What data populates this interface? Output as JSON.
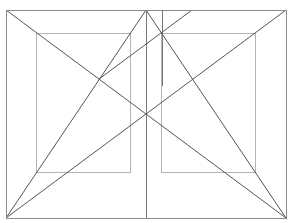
{
  "diagram": {
    "type": "geometric-composition-grid",
    "colors": {
      "background": "#ffffff",
      "outer_frame": "#8a8a8a",
      "inner_frames": "#b4b4b4",
      "diagonals": "#555555",
      "verticals": "#7a7a7a"
    },
    "outer_rect": {
      "x": 6,
      "y": 10,
      "w": 280,
      "h": 208
    },
    "inner_rects": [
      {
        "id": "left-inner",
        "x": 36,
        "y": 33,
        "w": 94,
        "h": 139
      },
      {
        "id": "right-inner",
        "x": 161,
        "y": 33,
        "w": 94,
        "h": 139
      }
    ],
    "vertical_lines": [
      {
        "id": "center-vertical",
        "x": 146,
        "y1": 10,
        "y2": 218
      },
      {
        "id": "short-vertical",
        "x": 162,
        "y1": 10,
        "y2": 86
      }
    ],
    "diagonal_lines": [
      {
        "id": "tl-to-br",
        "x1": 6,
        "y1": 10,
        "x2": 286,
        "y2": 218
      },
      {
        "id": "bl-to-tr",
        "x1": 6,
        "y1": 218,
        "x2": 286,
        "y2": 10
      },
      {
        "id": "bl-to-top-center",
        "x1": 6,
        "y1": 218,
        "x2": 146,
        "y2": 10
      },
      {
        "id": "top-center-to-br",
        "x1": 146,
        "y1": 10,
        "x2": 286,
        "y2": 218
      },
      {
        "id": "intersection-to-top",
        "x1": 99,
        "y1": 79,
        "x2": 192,
        "y2": 10
      }
    ]
  }
}
